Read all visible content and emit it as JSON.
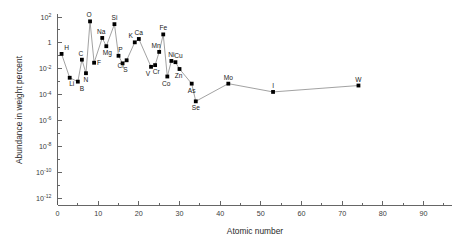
{
  "chart_data": {
    "type": "line",
    "title": "",
    "xlabel": "Atomic number",
    "ylabel": "Abundance in weight percent",
    "xlim": [
      0,
      97
    ],
    "ylim_log10": [
      -13,
      2.3
    ],
    "yscale": "log",
    "grid": false,
    "legend": null,
    "xticks": [
      0,
      10,
      20,
      30,
      40,
      50,
      60,
      70,
      80,
      90
    ],
    "xtick_labels": [
      "0",
      "10",
      "20",
      "30",
      "40",
      "50",
      "60",
      "70",
      "80",
      "90"
    ],
    "xminor_step": 5,
    "ytick_labels": [
      "10²",
      "1",
      "10⁻²",
      "10⁻⁴",
      "10⁻⁶",
      "10⁻⁸",
      "10⁻¹⁰",
      "10⁻¹²"
    ],
    "yticks_exponent": [
      2,
      0,
      -2,
      -4,
      -6,
      -8,
      -10,
      -12
    ],
    "ytick_base": [
      "10",
      "1",
      "10",
      "10",
      "10",
      "10",
      "10",
      "10"
    ],
    "ytick_exp_text": [
      "2",
      "",
      "-2",
      "-4",
      "-6",
      "-8",
      "-10",
      "-12"
    ],
    "point_color": "#000000",
    "line_color": "#8a8a8a",
    "axis_color": "#555555",
    "points": [
      {
        "label": "H",
        "x": 1,
        "y": 0.14,
        "lx": 5,
        "ly": -4
      },
      {
        "label": "Li",
        "x": 3,
        "y": 0.002,
        "lx": 2,
        "ly": 8
      },
      {
        "label": "B",
        "x": 5,
        "y": 0.001,
        "lx": 4,
        "ly": 9
      },
      {
        "label": "C",
        "x": 6,
        "y": 0.05,
        "lx": -1,
        "ly": -4
      },
      {
        "label": "N",
        "x": 7,
        "y": 0.0045,
        "lx": 0,
        "ly": 9
      },
      {
        "label": "O",
        "x": 8,
        "y": 46.0,
        "lx": -1,
        "ly": -4
      },
      {
        "label": "F",
        "x": 9,
        "y": 0.029,
        "lx": 5,
        "ly": 2
      },
      {
        "label": "Na",
        "x": 11,
        "y": 2.4,
        "lx": -1,
        "ly": -4
      },
      {
        "label": "Mg",
        "x": 12,
        "y": 0.55,
        "lx": 1,
        "ly": 9
      },
      {
        "label": "Si",
        "x": 14,
        "y": 28.0,
        "lx": 0,
        "ly": -4
      },
      {
        "label": "P",
        "x": 15,
        "y": 0.1,
        "lx": 2,
        "ly": -4
      },
      {
        "label": "S",
        "x": 16,
        "y": 0.026,
        "lx": 3,
        "ly": 9
      },
      {
        "label": "Cl",
        "x": 17,
        "y": 0.045,
        "lx": -6,
        "ly": 8
      },
      {
        "label": "K",
        "x": 19,
        "y": 1.1,
        "lx": -4,
        "ly": -4
      },
      {
        "label": "Ca",
        "x": 20,
        "y": 2.0,
        "lx": 0,
        "ly": -4
      },
      {
        "label": "V",
        "x": 23,
        "y": 0.014,
        "lx": -3,
        "ly": 9
      },
      {
        "label": "Cr",
        "x": 24,
        "y": 0.019,
        "lx": 1,
        "ly": 9
      },
      {
        "label": "Mn",
        "x": 25,
        "y": 0.2,
        "lx": -3,
        "ly": -4
      },
      {
        "label": "Fe",
        "x": 26,
        "y": 4.5,
        "lx": 0,
        "ly": -4
      },
      {
        "label": "Co",
        "x": 27,
        "y": 0.0025,
        "lx": -1,
        "ly": 9
      },
      {
        "label": "Ni",
        "x": 28,
        "y": 0.04,
        "lx": 0,
        "ly": -4
      },
      {
        "label": "Cu",
        "x": 29,
        "y": 0.032,
        "lx": 3,
        "ly": -4
      },
      {
        "label": "Zn",
        "x": 30,
        "y": 0.0095,
        "lx": -1,
        "ly": 9
      },
      {
        "label": "As",
        "x": 33,
        "y": 0.0007,
        "lx": 0,
        "ly": 9
      },
      {
        "label": "Se",
        "x": 34,
        "y": 3e-05,
        "lx": 0,
        "ly": 9
      },
      {
        "label": "Mo",
        "x": 42,
        "y": 0.0007,
        "lx": 0,
        "ly": -4
      },
      {
        "label": "I",
        "x": 53,
        "y": 0.00016,
        "lx": 0,
        "ly": -4
      },
      {
        "label": "W",
        "x": 74,
        "y": 0.0005,
        "lx": 0,
        "ly": -4
      }
    ]
  },
  "axes": {
    "x_title": "Atomic number",
    "y_title": "Abundance in weight percent"
  }
}
